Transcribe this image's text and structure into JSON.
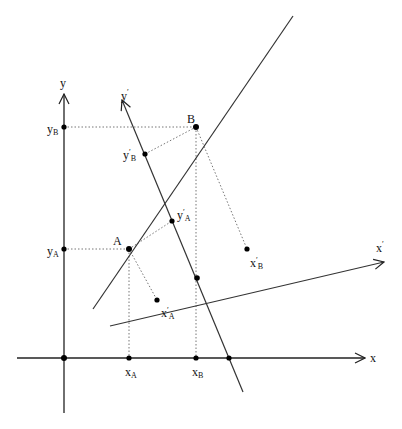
{
  "diagram": {
    "title": "",
    "axes": {
      "x": {
        "label": "x"
      },
      "y": {
        "label": "y"
      },
      "x_prime": {
        "label": "x",
        "prime": "′"
      },
      "y_prime": {
        "label": "y",
        "prime": "′"
      }
    },
    "points": {
      "A": {
        "label": "A"
      },
      "B": {
        "label": "B"
      }
    },
    "projections": {
      "xA": {
        "main": "x",
        "sub": "A"
      },
      "xB": {
        "main": "x",
        "sub": "B"
      },
      "yA": {
        "main": "y",
        "sub": "A"
      },
      "yB": {
        "main": "y",
        "sub": "B"
      },
      "xpA": {
        "main": "x",
        "prime": "′",
        "sub": "A"
      },
      "xpB": {
        "main": "x",
        "prime": "′",
        "sub": "B"
      },
      "ypA": {
        "main": "y",
        "prime": "′",
        "sub": "A"
      },
      "ypB": {
        "main": "y",
        "prime": "′",
        "sub": "B"
      }
    },
    "colors": {
      "line": "#333333",
      "dotted": "#666666",
      "background": "#ffffff"
    }
  }
}
